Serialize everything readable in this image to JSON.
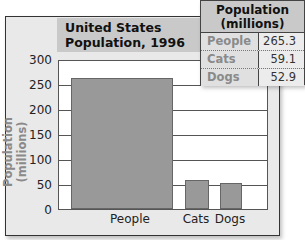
{
  "chart_data": {
    "type": "bar",
    "title": "United States Population, 1996",
    "title_lines": [
      "United States",
      "Population, 1996"
    ],
    "categories": [
      "People",
      "Cats",
      "Dogs"
    ],
    "values": [
      265.3,
      59.1,
      52.9
    ],
    "xlabel": "",
    "ylabel": "Population (millions)",
    "ylim": [
      0,
      300
    ],
    "yticks": [
      "0",
      "50",
      "100",
      "150",
      "200",
      "250",
      "300"
    ],
    "grid": true,
    "legend": null,
    "bar_color": "#999999"
  },
  "table": {
    "header": [
      "Population",
      "(millions)"
    ],
    "rows": [
      {
        "name": "People",
        "value": "265.3"
      },
      {
        "name": "Cats",
        "value": "59.1"
      },
      {
        "name": "Dogs",
        "value": "52.9"
      }
    ]
  }
}
